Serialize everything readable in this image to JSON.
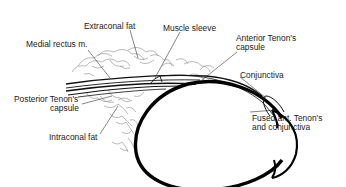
{
  "diagram": {
    "labels": {
      "extraconal_fat": "Extraconal fat",
      "muscle_sleeve": "Muscle sleeve",
      "medial_rectus": "Medial rectus m.",
      "anterior_tenon_line1": "Anterior Tenon's",
      "anterior_tenon_line2": "capsule",
      "conjunctiva": "Conjunctiva",
      "posterior_tenon_line1": "Posterior Tenon's",
      "posterior_tenon_line2": "capsule",
      "fused_line1": "Fused ant. Tenon's",
      "fused_line2": "and conjunctiva",
      "intraconal_fat": "Intraconal fat"
    },
    "colors": {
      "ink": "#111111",
      "fat_outline": "#888888",
      "leader": "#333333",
      "background": "#ffffff"
    }
  }
}
